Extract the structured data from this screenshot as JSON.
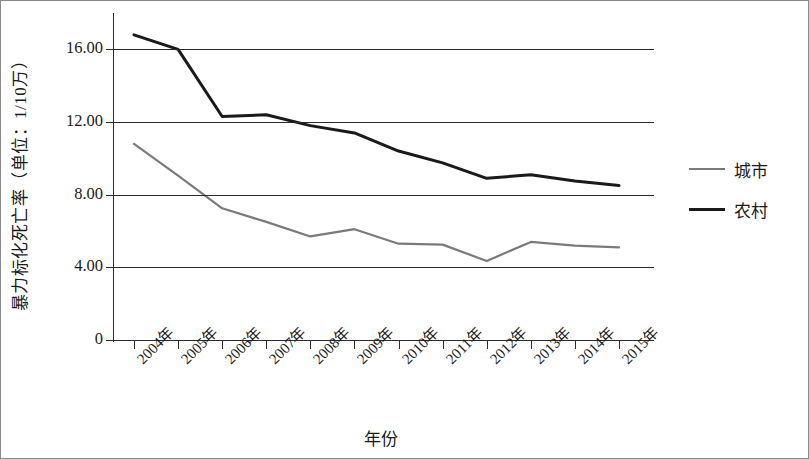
{
  "chart_data": {
    "type": "line",
    "title": "",
    "xlabel": "年份",
    "ylabel": "暴力标化死亡率（单位：1/10万）",
    "categories": [
      "2004年",
      "2005年",
      "2006年",
      "2007年",
      "2008年",
      "2009年",
      "2010年",
      "2011年",
      "2012年",
      "2013年",
      "2014年",
      "2015年"
    ],
    "series": [
      {
        "name": "城市",
        "color": "#7a7a7a",
        "values": [
          10.8,
          9.05,
          7.25,
          6.5,
          5.7,
          6.1,
          5.3,
          5.25,
          4.35,
          5.4,
          5.2,
          5.1
        ]
      },
      {
        "name": "农村",
        "color": "#1a1a1a",
        "values": [
          16.8,
          16.0,
          12.3,
          12.4,
          11.8,
          11.4,
          10.4,
          9.75,
          8.9,
          9.1,
          8.75,
          8.5
        ]
      }
    ],
    "ylim": [
      0,
      18
    ],
    "yticks": [
      "0",
      "4.00",
      "8.00",
      "12.00",
      "16.00"
    ],
    "ytick_values": [
      0,
      4,
      8,
      12,
      16
    ],
    "grid": "horizontal",
    "legend_position": "right"
  },
  "axes": {
    "y_title": "暴力标化死亡率（单位：1/10万）",
    "x_title": "年份"
  },
  "legend": {
    "items": [
      {
        "label": "城市",
        "color": "#7a7a7a"
      },
      {
        "label": "农村",
        "color": "#1a1a1a"
      }
    ]
  }
}
